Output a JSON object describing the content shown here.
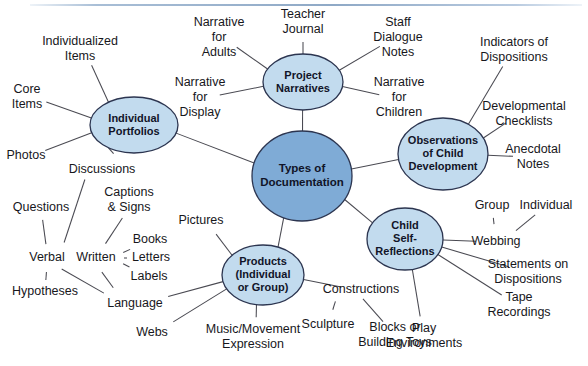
{
  "diagram": {
    "type": "mind-map",
    "center": {
      "id": "center",
      "label_lines": [
        "Types of",
        "Documentation"
      ],
      "cx": 302,
      "cy": 176,
      "rx": 50,
      "ry": 45,
      "color": "#7fabd6"
    },
    "branches": [
      {
        "id": "individual-portfolios",
        "label_lines": [
          "Individual",
          "Portfolios"
        ],
        "cx": 134,
        "cy": 125,
        "rx": 44,
        "ry": 28,
        "color": "#c2dbee",
        "leaves": [
          {
            "id": "individualized-items",
            "label_lines": [
              "Individualized",
              "Items"
            ],
            "x": 80,
            "y": 49
          },
          {
            "id": "core-items",
            "label_lines": [
              "Core",
              "Items"
            ],
            "x": 27,
            "y": 97
          },
          {
            "id": "photos",
            "label_lines": [
              "Photos"
            ],
            "x": 26,
            "y": 156
          },
          {
            "id": "discussions",
            "label_lines": [
              "Discussions"
            ],
            "x": 102,
            "y": 170
          }
        ]
      },
      {
        "id": "project-narratives",
        "label_lines": [
          "Project",
          "Narratives"
        ],
        "cx": 303,
        "cy": 82,
        "rx": 40,
        "ry": 28,
        "color": "#c2dbee",
        "leaves": [
          {
            "id": "narrative-for-adults",
            "label_lines": [
              "Narrative",
              "for",
              "Adults"
            ],
            "x": 219,
            "y": 38
          },
          {
            "id": "teacher-journal",
            "label_lines": [
              "Teacher",
              "Journal"
            ],
            "x": 303,
            "y": 22
          },
          {
            "id": "staff-dialogue-notes",
            "label_lines": [
              "Staff",
              "Dialogue",
              "Notes"
            ],
            "x": 398,
            "y": 38
          },
          {
            "id": "narrative-for-display",
            "label_lines": [
              "Narrative",
              "for",
              "Display"
            ],
            "x": 200,
            "y": 98
          },
          {
            "id": "narrative-for-children",
            "label_lines": [
              "Narrative",
              "for",
              "Children"
            ],
            "x": 399,
            "y": 98
          }
        ]
      },
      {
        "id": "observations-of-child-development",
        "label_lines": [
          "Observations",
          "of Child",
          "Development"
        ],
        "cx": 443,
        "cy": 154,
        "rx": 45,
        "ry": 36,
        "color": "#c2dbee",
        "leaves": [
          {
            "id": "indicators-of-dispositions",
            "label_lines": [
              "Indicators of",
              "Dispositions"
            ],
            "x": 514,
            "y": 50
          },
          {
            "id": "developmental-checklists",
            "label_lines": [
              "Developmental",
              "Checklists"
            ],
            "x": 524,
            "y": 114
          },
          {
            "id": "anecdotal-notes",
            "label_lines": [
              "Anecdotal",
              "Notes"
            ],
            "x": 533,
            "y": 157
          }
        ]
      },
      {
        "id": "child-self-reflections",
        "label_lines": [
          "Child",
          "Self-",
          "Reflections"
        ],
        "cx": 405,
        "cy": 239,
        "rx": 38,
        "ry": 31,
        "color": "#c2dbee",
        "leaves": [
          {
            "id": "webbing",
            "label_lines": [
              "Webbing"
            ],
            "x": 496,
            "y": 242
          },
          {
            "id": "group",
            "label_lines": [
              "Group"
            ],
            "x": 492,
            "y": 206
          },
          {
            "id": "individual",
            "label_lines": [
              "Individual"
            ],
            "x": 546,
            "y": 206
          },
          {
            "id": "statements-on-dispositions",
            "label_lines": [
              "Statements on",
              "Dispositions"
            ],
            "x": 528,
            "y": 272
          },
          {
            "id": "tape-recordings",
            "label_lines": [
              "Tape",
              "Recordings"
            ],
            "x": 519,
            "y": 305
          },
          {
            "id": "play-environments",
            "label_lines": [
              "Play",
              "Environments"
            ],
            "x": 424,
            "y": 336
          }
        ]
      },
      {
        "id": "products-individual-or-group",
        "label_lines": [
          "Products",
          "(Individual",
          "or Group)"
        ],
        "cx": 263,
        "cy": 275,
        "rx": 41,
        "ry": 30,
        "color": "#c2dbee",
        "leaves": [
          {
            "id": "pictures",
            "label_lines": [
              "Pictures"
            ],
            "x": 201,
            "y": 221
          },
          {
            "id": "constructions",
            "label_lines": [
              "Constructions"
            ],
            "x": 361,
            "y": 290
          },
          {
            "id": "sculpture",
            "label_lines": [
              "Sculpture"
            ],
            "x": 328,
            "y": 325
          },
          {
            "id": "blocks-or-building-toys",
            "label_lines": [
              "Blocks or",
              "Building Toys"
            ],
            "x": 395,
            "y": 335
          },
          {
            "id": "music-movement-expression",
            "label_lines": [
              "Music/Movement",
              "Expression"
            ],
            "x": 253,
            "y": 337
          },
          {
            "id": "webs",
            "label_lines": [
              "Webs"
            ],
            "x": 152,
            "y": 333
          },
          {
            "id": "language",
            "label_lines": [
              "Language"
            ],
            "x": 135,
            "y": 304
          }
        ]
      }
    ],
    "language_subtree": {
      "id": "language-subtree",
      "root": "language",
      "nodes": [
        {
          "id": "verbal",
          "label_lines": [
            "Verbal"
          ],
          "x": 47,
          "y": 258
        },
        {
          "id": "written",
          "label_lines": [
            "Written"
          ],
          "x": 96,
          "y": 258
        },
        {
          "id": "questions",
          "label_lines": [
            "Questions"
          ],
          "x": 41,
          "y": 208
        },
        {
          "id": "hypotheses",
          "label_lines": [
            "Hypotheses"
          ],
          "x": 45,
          "y": 292
        },
        {
          "id": "captions-and-signs",
          "label_lines": [
            "Captions",
            "& Signs"
          ],
          "x": 129,
          "y": 200
        },
        {
          "id": "books",
          "label_lines": [
            "Books"
          ],
          "x": 150,
          "y": 240
        },
        {
          "id": "letters",
          "label_lines": [
            "Letters"
          ],
          "x": 151,
          "y": 258
        },
        {
          "id": "labels",
          "label_lines": [
            "Labels"
          ],
          "x": 149,
          "y": 277
        }
      ]
    }
  },
  "colors": {
    "center_fill": "#7fabd6",
    "branch_fill": "#c2dbee",
    "node_stroke": "#2c3550",
    "edge": "#4a4a52",
    "text": "#17171c"
  }
}
